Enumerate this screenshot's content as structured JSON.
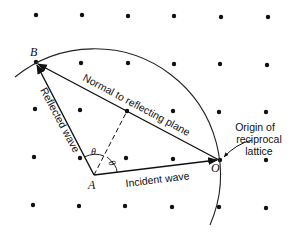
{
  "diagram": {
    "type": "ewald-sphere-construction",
    "points": {
      "B": {
        "label": "B",
        "x": 35,
        "y": 62
      },
      "A": {
        "label": "A",
        "x": 94,
        "y": 175
      },
      "O": {
        "label": "O",
        "x": 220,
        "y": 160
      }
    },
    "labels": {
      "normal": "Normal to reflecting plane",
      "reflected": "Reflected wave",
      "incident": "Incident wave",
      "origin_line1": "Origin of",
      "origin_line2": "reciprocal",
      "origin_line3": "lattice",
      "theta1": "θ",
      "theta2": "θ"
    },
    "lattice": {
      "rows": [
        [
          [
            36,
            15
          ],
          [
            82,
            15
          ],
          [
            128,
            16
          ],
          [
            174,
            16
          ],
          [
            221,
            17
          ],
          [
            268,
            17
          ]
        ],
        [
          [
            36,
            62
          ],
          [
            81,
            63
          ],
          [
            128,
            63
          ],
          [
            174,
            64
          ],
          [
            220,
            64
          ],
          [
            267,
            65
          ]
        ],
        [
          [
            35,
            109
          ],
          [
            80,
            110
          ],
          [
            127,
            111
          ],
          [
            173,
            111
          ],
          [
            219,
            112
          ],
          [
            266,
            112
          ]
        ],
        [
          [
            34,
            157
          ],
          [
            80,
            158
          ],
          [
            126,
            158
          ],
          [
            173,
            159
          ],
          [
            220,
            160
          ],
          [
            266,
            160
          ]
        ],
        [
          [
            33,
            205
          ],
          [
            79,
            206
          ],
          [
            125,
            206
          ],
          [
            172,
            207
          ],
          [
            219,
            207
          ],
          [
            266,
            208
          ]
        ]
      ]
    },
    "circle": {
      "cx": 94,
      "cy": 175,
      "r": 126
    }
  }
}
